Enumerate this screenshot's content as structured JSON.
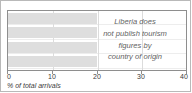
{
  "chart_data": {
    "type": "bar",
    "orientation": "horizontal",
    "title": "",
    "xlabel": "% of total arrivals",
    "ylabel": "",
    "categories": [
      "",
      "",
      "",
      ""
    ],
    "values": [
      20,
      20,
      20,
      20
    ],
    "xlim": [
      0,
      40
    ],
    "xticks": [
      0,
      10,
      20,
      30,
      40
    ],
    "xtick_labels": [
      "0",
      "10",
      "20",
      "30",
      "40"
    ],
    "grid": "vertical",
    "legend": "none",
    "bar_color": "#dedede",
    "annotation_lines": [
      "Liberia does",
      "not publish tourism",
      "figures by",
      "country of origin"
    ],
    "annotation_position": "right-inside-plot"
  },
  "axis": {
    "title": "% of total arrivals",
    "ticks": [
      {
        "label": "0",
        "value": 0
      },
      {
        "label": "10",
        "value": 10
      },
      {
        "label": "20",
        "value": 20
      },
      {
        "label": "30",
        "value": 30
      },
      {
        "label": "40",
        "value": 40
      }
    ]
  },
  "annotation": {
    "line1": "Liberia does",
    "line2": "not publish tourism",
    "line3": "figures by",
    "line4": "country of origin"
  }
}
